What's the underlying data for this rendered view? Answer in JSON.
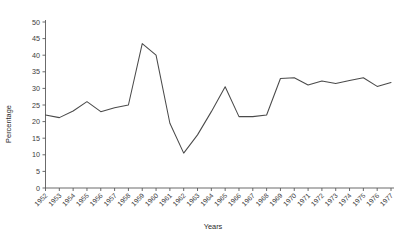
{
  "chart_data": {
    "type": "line",
    "title": "",
    "xlabel": "Years",
    "ylabel": "Percentage",
    "x": [
      1952,
      1953,
      1954,
      1955,
      1956,
      1957,
      1958,
      1959,
      1960,
      1961,
      1962,
      1963,
      1964,
      1965,
      1966,
      1967,
      1968,
      1969,
      1970,
      1971,
      1972,
      1973,
      1974,
      1975,
      1976,
      1977
    ],
    "values": [
      22.0,
      21.2,
      23.2,
      26.0,
      23.0,
      24.2,
      25.0,
      43.5,
      40.0,
      19.5,
      10.5,
      16.0,
      23.0,
      30.5,
      21.5,
      21.5,
      22.0,
      33.0,
      33.2,
      31.0,
      32.2,
      31.5,
      32.4,
      33.2,
      30.6,
      31.8
    ],
    "series": [
      {
        "name": "Percentage",
        "values": [
          22.0,
          21.2,
          23.2,
          26.0,
          23.0,
          24.2,
          25.0,
          43.5,
          40.0,
          19.5,
          10.5,
          16.0,
          23.0,
          30.5,
          21.5,
          21.5,
          22.0,
          33.0,
          33.2,
          31.0,
          32.2,
          31.5,
          32.4,
          33.2,
          30.6,
          31.8
        ],
        "color": "#4a4a4a"
      }
    ],
    "xlim": [
      1952,
      1977
    ],
    "ylim": [
      0,
      50
    ],
    "yticks": [
      0,
      5,
      10,
      15,
      20,
      25,
      30,
      35,
      40,
      45,
      50
    ],
    "ytick_labels": [
      "0",
      "5",
      "10",
      "15",
      "20",
      "25",
      "30",
      "35",
      "40",
      "45",
      "50"
    ],
    "xtick_labels": [
      "1952",
      "1953",
      "1954",
      "1955",
      "1956",
      "1957",
      "1958",
      "1959",
      "1960",
      "1961",
      "1962",
      "1963",
      "1964",
      "1965",
      "1966",
      "1967",
      "1968",
      "1969",
      "1970",
      "1971",
      "1972",
      "1973",
      "1974",
      "1975",
      "1976",
      "1977"
    ],
    "grid": false,
    "legend": false,
    "legend_position": "none",
    "xtick_label_rotation": -45,
    "line_color": "#4a4a4a",
    "axis_color": "#5a5a5a",
    "background_color": "#ffffff"
  }
}
